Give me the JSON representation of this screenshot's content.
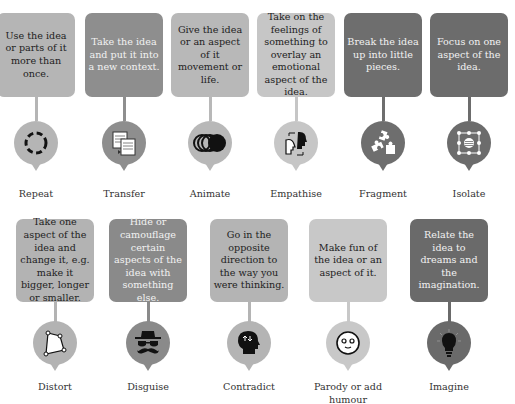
{
  "items": [
    {
      "id": "repeat",
      "label": "Repeat",
      "text": "Use the idea or parts of it more than once.",
      "icon": "dashed-circle-icon",
      "color": "#b5b5b5",
      "text_color": "dark"
    },
    {
      "id": "transfer",
      "label": "Transfer",
      "text": "Take the idea and put it into a new context.",
      "icon": "documents-transfer-icon",
      "color": "#8e8e8e",
      "text_color": "light"
    },
    {
      "id": "animate",
      "label": "Animate",
      "text": "Give the idea or an aspect of it movement or life.",
      "icon": "motion-circles-icon",
      "color": "#b8b8b8",
      "text_color": "dark"
    },
    {
      "id": "empathise",
      "label": "Empathise",
      "text": "Take on the feelings of something to overlay an emotional aspect of the idea.",
      "icon": "two-heads-icon",
      "color": "#c6c6c6",
      "text_color": "dark"
    },
    {
      "id": "fragment",
      "label": "Fragment",
      "text": "Break the idea up into little pieces.",
      "icon": "puzzle-pieces-icon",
      "color": "#6e6e6e",
      "text_color": "light"
    },
    {
      "id": "isolate",
      "label": "Isolate",
      "text": "Focus on one aspect of the idea.",
      "icon": "selection-box-icon",
      "color": "#6c6c6c",
      "text_color": "light"
    },
    {
      "id": "distort",
      "label": "Distort",
      "text": "Take one aspect of the idea and change it, e.g. make it bigger, longer or smaller.",
      "icon": "distorted-shape-icon",
      "color": "#b3b3b3",
      "text_color": "dark"
    },
    {
      "id": "disguise",
      "label": "Disguise",
      "text": "Hide or camouflage certain aspects of the idea with something else.",
      "icon": "hat-glasses-moustache-icon",
      "color": "#8a8a8a",
      "text_color": "light"
    },
    {
      "id": "contradict",
      "label": "Contradict",
      "text": "Go in the opposite direction to the way you were thinking.",
      "icon": "head-arrows-icon",
      "color": "#b4b4b4",
      "text_color": "dark"
    },
    {
      "id": "parody",
      "label": "Parody or add humour",
      "text": "Make fun of the idea or an aspect of it.",
      "icon": "smiley-face-icon",
      "color": "#c8c8c8",
      "text_color": "dark"
    },
    {
      "id": "imagine",
      "label": "Imagine",
      "text": "Relate the idea to dreams and the imagination.",
      "icon": "lightbulb-icon",
      "color": "#6a6a6a",
      "text_color": "light"
    }
  ]
}
